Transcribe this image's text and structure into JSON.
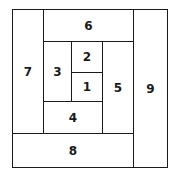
{
  "diagram": {
    "type": "log-cabin-spiral-partition",
    "cells": [
      {
        "label": "1",
        "x": 71,
        "y": 72,
        "w": 32,
        "h": 30
      },
      {
        "label": "2",
        "x": 71,
        "y": 41,
        "w": 32,
        "h": 32
      },
      {
        "label": "3",
        "x": 43,
        "y": 41,
        "w": 29,
        "h": 61
      },
      {
        "label": "4",
        "x": 43,
        "y": 101,
        "w": 60,
        "h": 33
      },
      {
        "label": "5",
        "x": 102,
        "y": 41,
        "w": 32,
        "h": 93
      },
      {
        "label": "6",
        "x": 43,
        "y": 9,
        "w": 91,
        "h": 33
      },
      {
        "label": "7",
        "x": 12,
        "y": 9,
        "w": 32,
        "h": 125
      },
      {
        "label": "8",
        "x": 12,
        "y": 133,
        "w": 122,
        "h": 35
      },
      {
        "label": "9",
        "x": 133,
        "y": 9,
        "w": 35,
        "h": 159
      }
    ]
  }
}
